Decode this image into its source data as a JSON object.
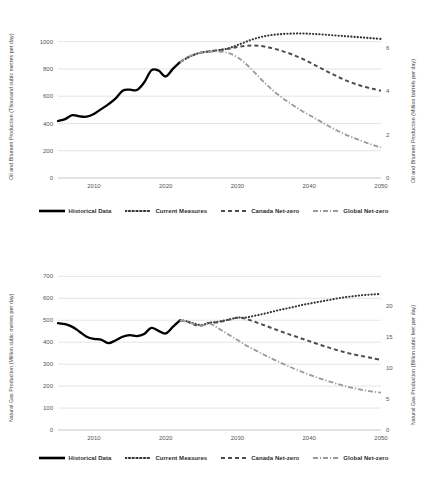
{
  "legend": {
    "items": [
      {
        "label": "Historical Data",
        "style": "solid",
        "color": "#000000"
      },
      {
        "label": "Current Measures",
        "style": "dotted",
        "color": "#333333"
      },
      {
        "label": "Canada Net-zero",
        "style": "dashed",
        "color": "#4d4d4d"
      },
      {
        "label": "Global Net-zero",
        "style": "dashdot",
        "color": "#9a9a9a"
      }
    ]
  },
  "chart_data": [
    {
      "type": "line",
      "id": "oil-bitumen",
      "title": "",
      "xlabel": "",
      "ylabel": "Oil and Bitumen Production (Thousand cubic metres per day)",
      "ylabel_right": "Oil and Bitumen Production (Million barrels per day)",
      "xlim": [
        2005,
        2050
      ],
      "ylim": [
        0,
        1100
      ],
      "yticks": [
        0,
        200,
        400,
        600,
        800,
        1000
      ],
      "yticks_right": [
        0,
        2,
        4,
        6
      ],
      "ylim_right": [
        0,
        6.92
      ],
      "xticks": [
        2010,
        2020,
        2030,
        2040,
        2050
      ],
      "grid": true,
      "legend_position": "bottom",
      "series": [
        {
          "name": "Historical Data",
          "style": "solid",
          "x": [
            2005,
            2006,
            2007,
            2008,
            2009,
            2010,
            2011,
            2012,
            2013,
            2014,
            2015,
            2016,
            2017,
            2018,
            2019,
            2020,
            2021,
            2022
          ],
          "values": [
            418,
            432,
            461,
            452,
            450,
            470,
            505,
            540,
            582,
            640,
            648,
            645,
            700,
            790,
            788,
            745,
            800,
            850
          ]
        },
        {
          "name": "Current Measures",
          "style": "dotted",
          "x": [
            2022,
            2023,
            2024,
            2025,
            2026,
            2027,
            2028,
            2029,
            2030,
            2031,
            2032,
            2033,
            2034,
            2035,
            2036,
            2037,
            2038,
            2039,
            2040,
            2041,
            2042,
            2043,
            2044,
            2045,
            2046,
            2047,
            2048,
            2049,
            2050
          ],
          "values": [
            850,
            880,
            905,
            920,
            928,
            935,
            942,
            955,
            975,
            995,
            1015,
            1030,
            1042,
            1050,
            1055,
            1058,
            1060,
            1060,
            1058,
            1055,
            1052,
            1048,
            1044,
            1040,
            1036,
            1032,
            1028,
            1024,
            1020
          ]
        },
        {
          "name": "Canada Net-zero",
          "style": "dashed",
          "x": [
            2022,
            2023,
            2024,
            2025,
            2026,
            2027,
            2028,
            2029,
            2030,
            2031,
            2032,
            2033,
            2034,
            2035,
            2036,
            2037,
            2038,
            2039,
            2040,
            2041,
            2042,
            2043,
            2044,
            2045,
            2046,
            2047,
            2048,
            2049,
            2050
          ],
          "values": [
            850,
            882,
            905,
            920,
            928,
            935,
            942,
            950,
            960,
            968,
            972,
            970,
            962,
            950,
            935,
            918,
            898,
            875,
            850,
            822,
            795,
            768,
            742,
            718,
            698,
            680,
            665,
            652,
            640
          ]
        },
        {
          "name": "Global Net-zero",
          "style": "dashdot",
          "x": [
            2022,
            2023,
            2024,
            2025,
            2026,
            2027,
            2028,
            2029,
            2030,
            2031,
            2032,
            2033,
            2034,
            2035,
            2036,
            2037,
            2038,
            2039,
            2040,
            2041,
            2042,
            2043,
            2044,
            2045,
            2046,
            2047,
            2048,
            2049,
            2050
          ],
          "values": [
            850,
            885,
            908,
            920,
            925,
            928,
            925,
            912,
            885,
            845,
            795,
            740,
            688,
            640,
            598,
            560,
            525,
            492,
            462,
            432,
            402,
            372,
            345,
            320,
            298,
            278,
            258,
            240,
            225
          ]
        }
      ]
    },
    {
      "type": "line",
      "id": "natural-gas",
      "title": "",
      "xlabel": "",
      "ylabel": "Natural Gas Production (Million cubic metres per day)",
      "ylabel_right": "Natural Gas Production (Billion cubic feet per day)",
      "xlim": [
        2005,
        2050
      ],
      "ylim": [
        0,
        720
      ],
      "yticks": [
        0,
        100,
        200,
        300,
        400,
        500,
        600,
        700
      ],
      "yticks_right": [
        0,
        5,
        10,
        15,
        20
      ],
      "ylim_right": [
        0,
        25.4
      ],
      "xticks": [
        2010,
        2020,
        2030,
        2040,
        2050
      ],
      "grid": true,
      "legend_position": "bottom",
      "series": [
        {
          "name": "Historical Data",
          "style": "solid",
          "x": [
            2005,
            2006,
            2007,
            2008,
            2009,
            2010,
            2011,
            2012,
            2013,
            2014,
            2015,
            2016,
            2017,
            2018,
            2019,
            2020,
            2021,
            2022
          ],
          "values": [
            487,
            482,
            470,
            448,
            425,
            415,
            412,
            396,
            408,
            425,
            432,
            428,
            438,
            465,
            452,
            440,
            470,
            500
          ]
        },
        {
          "name": "Current Measures",
          "style": "dotted",
          "x": [
            2022,
            2023,
            2024,
            2025,
            2026,
            2027,
            2028,
            2029,
            2030,
            2031,
            2032,
            2033,
            2034,
            2035,
            2036,
            2037,
            2038,
            2039,
            2040,
            2041,
            2042,
            2043,
            2044,
            2045,
            2046,
            2047,
            2048,
            2049,
            2050
          ],
          "values": [
            500,
            495,
            485,
            478,
            488,
            492,
            498,
            505,
            512,
            512,
            518,
            525,
            532,
            540,
            548,
            555,
            562,
            570,
            576,
            582,
            588,
            594,
            600,
            605,
            609,
            613,
            616,
            618,
            620
          ]
        },
        {
          "name": "Canada Net-zero",
          "style": "dashed",
          "x": [
            2022,
            2023,
            2024,
            2025,
            2026,
            2027,
            2028,
            2029,
            2030,
            2031,
            2032,
            2033,
            2034,
            2035,
            2036,
            2037,
            2038,
            2039,
            2040,
            2041,
            2042,
            2043,
            2044,
            2045,
            2046,
            2047,
            2048,
            2049,
            2050
          ],
          "values": [
            500,
            494,
            480,
            476,
            488,
            490,
            496,
            504,
            512,
            508,
            498,
            486,
            474,
            462,
            450,
            438,
            427,
            416,
            405,
            394,
            383,
            373,
            363,
            354,
            346,
            339,
            333,
            326,
            320
          ]
        },
        {
          "name": "Global Net-zero",
          "style": "dashdot",
          "x": [
            2022,
            2023,
            2024,
            2025,
            2026,
            2027,
            2028,
            2029,
            2030,
            2031,
            2032,
            2033,
            2034,
            2035,
            2036,
            2037,
            2038,
            2039,
            2040,
            2041,
            2042,
            2043,
            2044,
            2045,
            2046,
            2047,
            2048,
            2049,
            2050
          ],
          "values": [
            500,
            494,
            482,
            476,
            486,
            470,
            450,
            430,
            410,
            390,
            372,
            355,
            338,
            322,
            307,
            292,
            278,
            265,
            252,
            240,
            229,
            219,
            209,
            200,
            192,
            185,
            179,
            174,
            170
          ]
        }
      ]
    }
  ]
}
